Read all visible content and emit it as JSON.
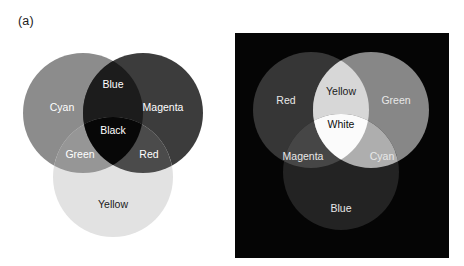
{
  "figure": {
    "width": 464,
    "height": 266,
    "background": "#ffffff",
    "rendering": "grayscale halftone reproduction of a color figure"
  },
  "panels": [
    {
      "id": "a",
      "label": "(a)",
      "caption_label": "(a)",
      "model": "subtractive",
      "background": "#ffffff",
      "primaries": [
        "Cyan",
        "Magenta",
        "Yellow"
      ],
      "center": "Black",
      "regions": [
        {
          "name": "Cyan",
          "label": "Cyan",
          "kind": "primary",
          "fill": "#8c8c8c",
          "text_color": "#ffffff",
          "x": 62,
          "y": 108
        },
        {
          "name": "Magenta",
          "label": "Magenta",
          "kind": "primary",
          "fill": "#3c3c3c",
          "text_color": "#ffffff",
          "x": 163,
          "y": 108
        },
        {
          "name": "Yellow",
          "label": "Yellow",
          "kind": "primary",
          "fill": "#e2e2e2",
          "text_color": "#1b1b1b",
          "x": 113,
          "y": 205
        },
        {
          "name": "Blue",
          "label": "Blue",
          "kind": "pair",
          "fill": "#1c1c1c",
          "text_color": "#ffffff",
          "x": 113,
          "y": 85
        },
        {
          "name": "Green",
          "label": "Green",
          "kind": "pair",
          "fill": "#969696",
          "text_color": "#ffffff",
          "x": 80,
          "y": 155
        },
        {
          "name": "Red",
          "label": "Red",
          "kind": "pair",
          "fill": "#4b4b4b",
          "text_color": "#ffffff",
          "x": 149,
          "y": 155
        },
        {
          "name": "Black",
          "label": "Black",
          "kind": "triple",
          "fill": "#070707",
          "text_color": "#ffffff",
          "x": 113,
          "y": 131
        }
      ],
      "circles": [
        {
          "name": "cyan-circle",
          "cx": 83,
          "cy": 113,
          "r": 60
        },
        {
          "name": "magenta-circle",
          "cx": 143,
          "cy": 113,
          "r": 60
        },
        {
          "name": "yellow-circle",
          "cx": 113,
          "cy": 177,
          "r": 60
        }
      ]
    },
    {
      "id": "b",
      "label": "(b)",
      "caption_label": "(b)",
      "model": "additive",
      "background": "#050505",
      "primaries": [
        "Red",
        "Green",
        "Blue"
      ],
      "center": "White",
      "regions": [
        {
          "name": "Red",
          "label": "Red",
          "kind": "primary",
          "fill": "#363636",
          "text_color": "#e8e8e8",
          "x": 54,
          "y": 101
        },
        {
          "name": "Green",
          "label": "Green",
          "kind": "primary",
          "fill": "#878787",
          "text_color": "#e8e8e8",
          "x": 164,
          "y": 101
        },
        {
          "name": "Blue",
          "label": "Blue",
          "kind": "primary",
          "fill": "#232323",
          "text_color": "#e8e8e8",
          "x": 109,
          "y": 209
        },
        {
          "name": "Yellow",
          "label": "Yellow",
          "kind": "pair",
          "fill": "#d7d7d7",
          "text_color": "#1b1b1b",
          "x": 109,
          "y": 92
        },
        {
          "name": "Magenta",
          "label": "Magenta",
          "kind": "pair",
          "fill": "#464646",
          "text_color": "#e8e8e8",
          "x": 71,
          "y": 157
        },
        {
          "name": "Cyan",
          "label": "Cyan",
          "kind": "pair",
          "fill": "#aeaeae",
          "text_color": "#e8e8e8",
          "x": 150,
          "y": 157
        },
        {
          "name": "White",
          "label": "White",
          "kind": "triple",
          "fill": "#fbfbfb",
          "text_color": "#0d0d0d",
          "x": 109,
          "y": 125
        }
      ],
      "circles": [
        {
          "name": "red-circle",
          "cx": 79,
          "cy": 110,
          "r": 58
        },
        {
          "name": "green-circle",
          "cx": 139,
          "cy": 110,
          "r": 58
        },
        {
          "name": "blue-circle",
          "cx": 109,
          "cy": 172,
          "r": 58
        }
      ],
      "plate": {
        "x": 3,
        "y": 33,
        "width": 214,
        "height": 225
      }
    }
  ]
}
